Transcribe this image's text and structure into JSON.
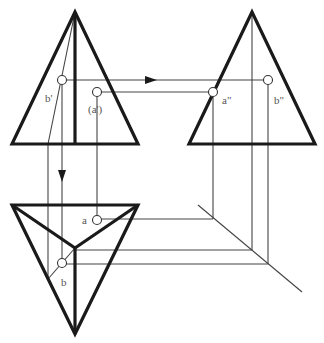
{
  "diagram": {
    "type": "orthographic-projection",
    "colors": {
      "outline": "#1a1a1a",
      "projector": "#444444",
      "label": "#555555",
      "background": "#ffffff"
    },
    "views": {
      "front": {
        "name": "front-view",
        "shape": "triangle"
      },
      "side": {
        "name": "side-view",
        "shape": "triangle"
      },
      "top": {
        "name": "top-view",
        "shape": "triangle-with-center-vertex"
      }
    },
    "labels": {
      "b_front": "b'",
      "a_front": "(a')",
      "a_side": "a\"",
      "b_side": "b\"",
      "a_top": "a",
      "b_top": "b"
    }
  }
}
